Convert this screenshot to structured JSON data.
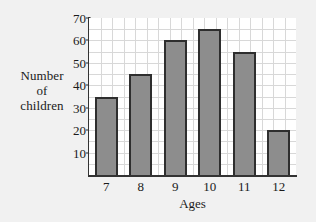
{
  "chart_data": {
    "type": "bar",
    "title": "",
    "xlabel": "Ages",
    "ylabel_lines": [
      "Number",
      "of",
      "children"
    ],
    "categories": [
      "7",
      "8",
      "9",
      "10",
      "11",
      "12"
    ],
    "values": [
      35,
      45,
      60,
      65,
      55,
      20
    ],
    "ylim": [
      0,
      70
    ],
    "ytick_values": [
      10,
      20,
      30,
      40,
      50,
      60,
      70
    ],
    "ytick_labels": [
      "10",
      "20",
      "30",
      "40",
      "50",
      "60",
      "70"
    ],
    "grid": "light gray gridlines every 5 units vertically and between categories",
    "grid_step": 5,
    "legend": "none",
    "colors": {
      "bar_fill": "#8d8d8d",
      "bar_border": "#2e2e2e",
      "grid": "#d8d8d8",
      "axis": "#333333",
      "plot_background": "#ffffff",
      "page_background": "#f1f1f1",
      "text": "#1b1b1b"
    }
  }
}
